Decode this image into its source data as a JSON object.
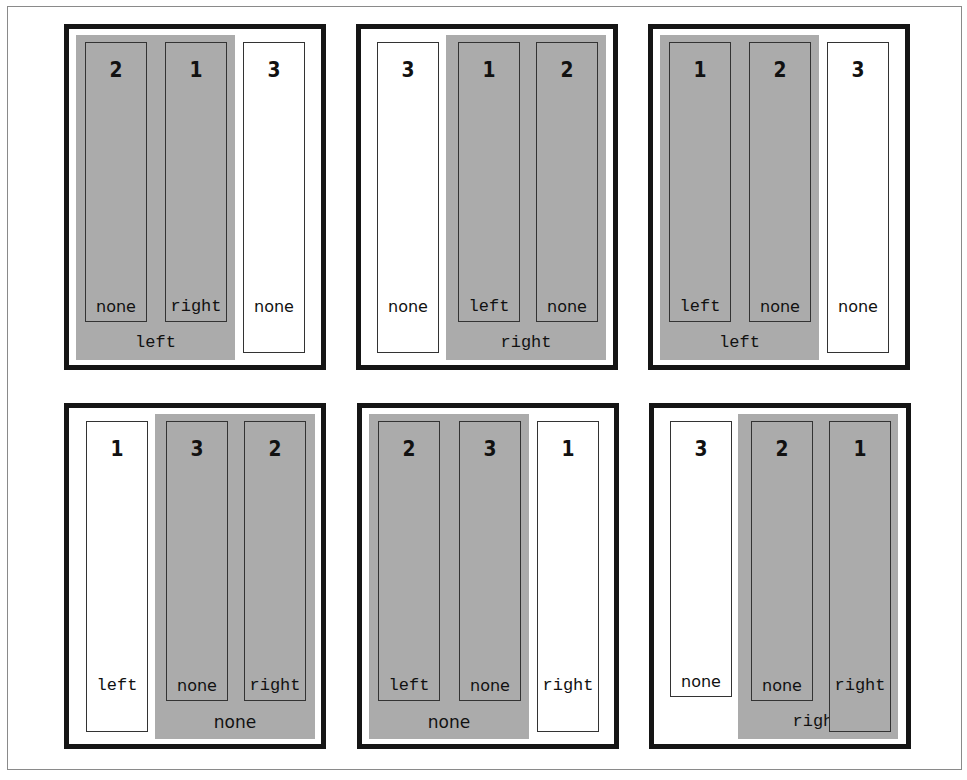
{
  "figure": {
    "colors": {
      "group_fill": "#ababab",
      "panel_border": "#151515",
      "box_border": "#333333"
    },
    "panels": [
      {
        "container_float": "left",
        "boxes": [
          {
            "number": "2",
            "float": "none",
            "in_group": true
          },
          {
            "number": "1",
            "float": "right",
            "in_group": true
          },
          {
            "number": "3",
            "float": "none",
            "in_group": false
          }
        ]
      },
      {
        "container_float": "right",
        "boxes": [
          {
            "number": "3",
            "float": "none",
            "in_group": false
          },
          {
            "number": "1",
            "float": "left",
            "in_group": true
          },
          {
            "number": "2",
            "float": "none",
            "in_group": true
          }
        ]
      },
      {
        "container_float": "left",
        "boxes": [
          {
            "number": "1",
            "float": "left",
            "in_group": true
          },
          {
            "number": "2",
            "float": "none",
            "in_group": true
          },
          {
            "number": "3",
            "float": "none",
            "in_group": false
          }
        ]
      },
      {
        "container_float": "none",
        "boxes": [
          {
            "number": "1",
            "float": "left",
            "in_group": false
          },
          {
            "number": "3",
            "float": "none",
            "in_group": true
          },
          {
            "number": "2",
            "float": "right",
            "in_group": true
          }
        ]
      },
      {
        "container_float": "none",
        "boxes": [
          {
            "number": "2",
            "float": "left",
            "in_group": true
          },
          {
            "number": "3",
            "float": "none",
            "in_group": true
          },
          {
            "number": "1",
            "float": "right",
            "in_group": false
          }
        ]
      },
      {
        "container_float": "right",
        "boxes": [
          {
            "number": "3",
            "float": "none",
            "in_group": false
          },
          {
            "number": "2",
            "float": "none",
            "in_group": true
          },
          {
            "number": "1",
            "float": "right",
            "in_group": true
          }
        ]
      }
    ]
  }
}
